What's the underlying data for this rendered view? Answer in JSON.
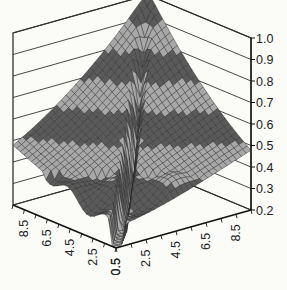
{
  "chart_data": {
    "type": "surface3d",
    "title": "",
    "xlabel": "",
    "ylabel": "",
    "zlabel": "",
    "x_ticks": [
      "0.5",
      "2.5",
      "4.5",
      "6.5",
      "8.5"
    ],
    "y_ticks": [
      "0.5",
      "2.5",
      "4.5",
      "6.5",
      "8.5"
    ],
    "z_ticks": [
      "1.0",
      "0.9",
      "0.8",
      "0.7",
      "0.6",
      "0.5",
      "0.4",
      "0.3",
      "0.2"
    ],
    "zlim": [
      0.2,
      1.0
    ],
    "xlim": [
      0.5,
      9.5
    ],
    "ylim": [
      0.5,
      9.5
    ],
    "grid": true,
    "band_colors": [
      "#5a5a5a",
      "#a8a8a8"
    ],
    "band_interval": 0.1,
    "peak_value": 1.0,
    "edge_value": 0.3,
    "trough_min": 0.2
  }
}
